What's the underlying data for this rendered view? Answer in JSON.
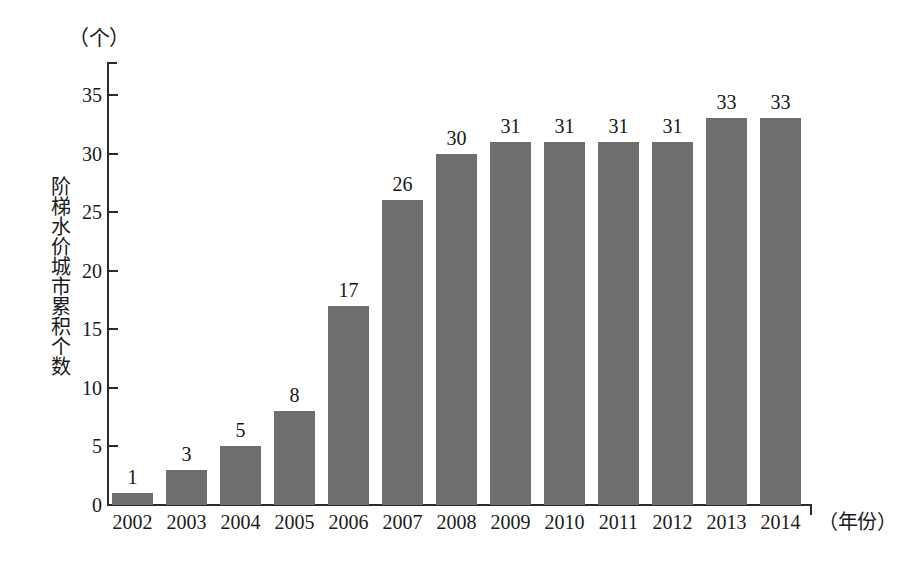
{
  "chart_data": {
    "type": "bar",
    "title": "",
    "subtitle": "",
    "xlabel": "（年份）",
    "ylabel": "阶梯水价城市累积个数",
    "yunit": "（个）",
    "categories": [
      "2002",
      "2003",
      "2004",
      "2005",
      "2006",
      "2007",
      "2008",
      "2009",
      "2010",
      "2011",
      "2012",
      "2013",
      "2014"
    ],
    "values": [
      1,
      3,
      5,
      8,
      17,
      26,
      30,
      31,
      31,
      31,
      31,
      33,
      33
    ],
    "value_labels": [
      "1",
      "3",
      "5",
      "8",
      "17",
      "26",
      "30",
      "31",
      "31",
      "31",
      "31",
      "33",
      "33"
    ],
    "ylim": [
      0,
      35
    ],
    "yticks": [
      0,
      5,
      10,
      15,
      20,
      25,
      30,
      35
    ],
    "ytick_labels": [
      "0",
      "5",
      "10",
      "15",
      "20",
      "25",
      "30",
      "35"
    ],
    "grid": false,
    "legend": null,
    "legend_position": "none",
    "series": [
      {
        "name": "阶梯水价城市累积个数",
        "values": [
          1,
          3,
          5,
          8,
          17,
          26,
          30,
          31,
          31,
          31,
          31,
          33,
          33
        ]
      }
    ],
    "annotations": [],
    "colors": {
      "bar_fill": "#6e6e6e",
      "axis": "#2b2b2b",
      "text": "#1a1a1a",
      "background": "#ffffff"
    }
  }
}
